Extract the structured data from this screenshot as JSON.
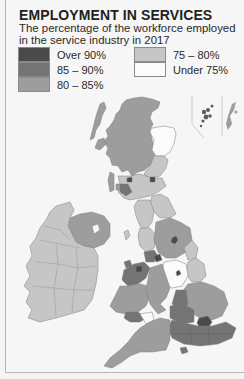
{
  "header": {
    "title": "EMPLOYMENT IN SERVICES",
    "subtitle": "The percentage of the workforce employed in the service industry in 2017"
  },
  "legend": {
    "items": [
      {
        "label": "Over 90%",
        "color": "#4a4a4a"
      },
      {
        "label": "85 – 90%",
        "color": "#747474"
      },
      {
        "label": "80 – 85%",
        "color": "#9d9d9d"
      },
      {
        "label": "75 – 80%",
        "color": "#c6c6c6"
      },
      {
        "label": "Under 75%",
        "color": "#fbfbfb"
      }
    ]
  },
  "map": {
    "subject": "United Kingdom and Ireland",
    "regions": [
      {
        "name": "Scotland Highlands & Islands",
        "class": "80 – 85%"
      },
      {
        "name": "Aberdeenshire (North-East Scotland)",
        "class": "Under 75%"
      },
      {
        "name": "Eastern Scotland",
        "class": "75 – 80%"
      },
      {
        "name": "Glasgow / Edinburgh cities",
        "class": "Over 90%"
      },
      {
        "name": "Southern Scotland",
        "class": "75 – 80%"
      },
      {
        "name": "Northern Ireland",
        "class": "80 – 85%"
      },
      {
        "name": "Republic of Ireland",
        "class": "75 – 80%"
      },
      {
        "name": "North-East England",
        "class": "75 – 80%"
      },
      {
        "name": "Cumbria",
        "class": "75 – 80%"
      },
      {
        "name": "Yorkshire",
        "class": "80 – 85%"
      },
      {
        "name": "Lancashire / Merseyside",
        "class": "85 – 90%"
      },
      {
        "name": "Manchester / Liverpool cities",
        "class": "Over 90%"
      },
      {
        "name": "Lincolnshire",
        "class": "75 – 80%"
      },
      {
        "name": "East Midlands",
        "class": "Under 75%"
      },
      {
        "name": "West Midlands",
        "class": "80 – 85%"
      },
      {
        "name": "Wales",
        "class": "80 – 85%"
      },
      {
        "name": "Powys",
        "class": "75 – 80%"
      },
      {
        "name": "East of England",
        "class": "80 – 85%"
      },
      {
        "name": "Greater London",
        "class": "Over 90%"
      },
      {
        "name": "South-East England",
        "class": "85 – 90%"
      },
      {
        "name": "South-West England",
        "class": "80 – 85%"
      },
      {
        "name": "Orkney",
        "class": "85 – 90%"
      },
      {
        "name": "Shetland",
        "class": "80 – 85%"
      }
    ]
  }
}
